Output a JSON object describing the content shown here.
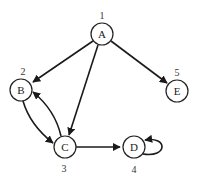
{
  "diagram": {
    "type": "directed-graph",
    "nodes": [
      {
        "id": "A",
        "label": "A",
        "number": "1",
        "x": 102,
        "y": 34
      },
      {
        "id": "B",
        "label": "B",
        "number": "2",
        "x": 21,
        "y": 90
      },
      {
        "id": "C",
        "label": "C",
        "number": "3",
        "x": 65,
        "y": 147
      },
      {
        "id": "D",
        "label": "D",
        "number": "4",
        "x": 134,
        "y": 147
      },
      {
        "id": "E",
        "label": "E",
        "number": "5",
        "x": 177,
        "y": 91
      }
    ],
    "edges": [
      {
        "from": "A",
        "to": "B"
      },
      {
        "from": "A",
        "to": "C"
      },
      {
        "from": "A",
        "to": "E"
      },
      {
        "from": "B",
        "to": "C"
      },
      {
        "from": "C",
        "to": "B"
      },
      {
        "from": "C",
        "to": "D"
      },
      {
        "from": "D",
        "to": "D"
      }
    ]
  }
}
